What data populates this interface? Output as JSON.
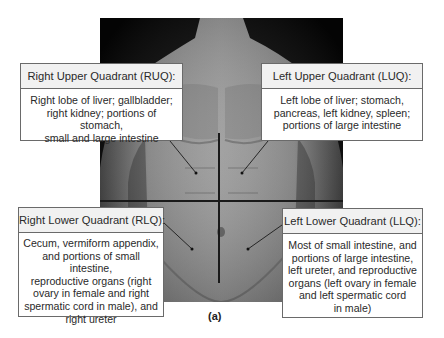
{
  "figure": {
    "caption": "(a)"
  },
  "quadrants": {
    "ruq": {
      "title": "Right Upper Quadrant (RUQ):",
      "contents": "Right lobe of liver; gallbladder;\nright kidney; portions of stomach,\nsmall  and large intestine"
    },
    "luq": {
      "title": "Left Upper Quadrant (LUQ):",
      "contents": "Left lobe of liver; stomach,\npancreas, left kidney, spleen;\nportions of large intestine"
    },
    "rlq": {
      "title": "Right Lower Quadrant (RLQ):",
      "contents": "Cecum, vermiform appendix,\nand portions of small intestine,\nreproductive organs (right\novary in female and right\nspermatic cord in male), and\nright ureter"
    },
    "llq": {
      "title": "Left Lower Quadrant (LLQ):",
      "contents": "Most of small intestine, and\nportions of large intestine,\nleft ureter, and reproductive\norgans (left ovary in female\nand left spermatic cord\nin male)"
    }
  },
  "colors": {
    "box_border": "#6a6a6a",
    "header_bg": "#f1f1f1",
    "text": "#2a2a2a",
    "photo_bg": "#050505"
  }
}
